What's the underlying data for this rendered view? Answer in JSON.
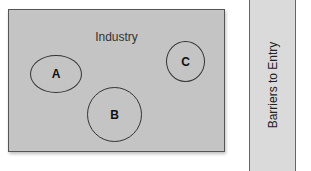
{
  "industry": {
    "label": "Industry",
    "firms": [
      {
        "id": "A",
        "label": "A"
      },
      {
        "id": "B",
        "label": "B"
      },
      {
        "id": "C",
        "label": "C"
      }
    ]
  },
  "barrier": {
    "label": "Barriers to Entry"
  },
  "colors": {
    "industry_fill": "#c4c4c4",
    "barrier_fill": "#dadada",
    "outline": "#333333"
  }
}
